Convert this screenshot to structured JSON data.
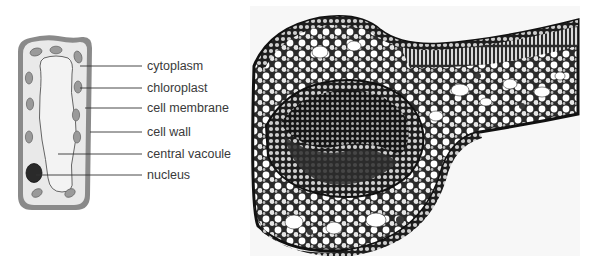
{
  "cell_diagram": {
    "title": "Plant cell",
    "colors": {
      "cell_wall": "#8a8a8a",
      "cytoplasm": "#e9e9e9",
      "vacuole": "#f3f3f3",
      "chloroplast": "#9a9a9a",
      "nucleus": "#2a2a2a",
      "leader_line": "#333333"
    },
    "labels": [
      {
        "id": "cytoplasm",
        "text": "cytoplasm"
      },
      {
        "id": "chloroplast",
        "text": "chloroplast"
      },
      {
        "id": "cell-membrane",
        "text": "cell membrane"
      },
      {
        "id": "cell-wall",
        "text": "cell wall"
      },
      {
        "id": "central-vacuole",
        "text": "central vacoule"
      },
      {
        "id": "nucleus",
        "text": "nucleus"
      }
    ]
  },
  "micrograph": {
    "subject": "Leaf cross-section micrograph (midrib with vascular bundle)",
    "colors": {
      "background": "#f7f7f7",
      "tissue_dark": "#1e1e1e",
      "tissue_mid": "#6b6b6b",
      "cell_lumen": "#ffffff"
    }
  }
}
